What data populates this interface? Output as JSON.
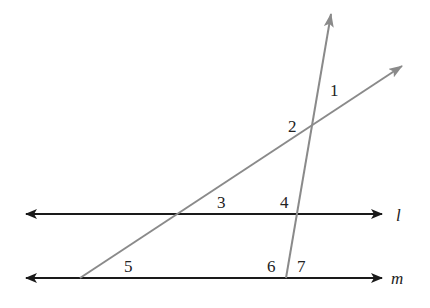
{
  "diagram": {
    "type": "parallel-lines-transversals",
    "lines": {
      "l": {
        "label": "l",
        "color": "#1a1a1a"
      },
      "m": {
        "label": "m",
        "color": "#1a1a1a"
      },
      "t1": {
        "color": "#8a8a8a"
      },
      "t2": {
        "color": "#8a8a8a"
      }
    },
    "angles": [
      "1",
      "2",
      "3",
      "4",
      "5",
      "6",
      "7"
    ]
  }
}
